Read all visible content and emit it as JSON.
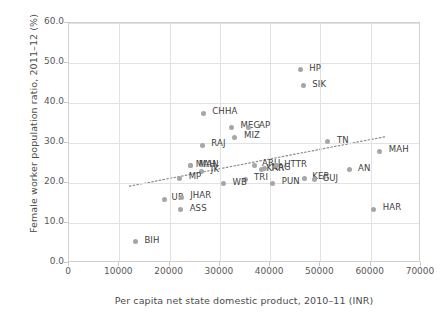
{
  "chart_data": {
    "type": "scatter",
    "title": "",
    "xlabel": "Per capita net state domestic product, 2010–11 (INR)",
    "ylabel": "Female worker population ratio, 2011–12 (%)",
    "xlim": [
      0,
      70000
    ],
    "ylim": [
      0,
      60
    ],
    "xticks": [
      "0",
      "10000",
      "20000",
      "30000",
      "40000",
      "50000",
      "60000",
      "70000"
    ],
    "yticks": [
      "0.0",
      "10.0",
      "20.0",
      "30.0",
      "40.0",
      "50.0",
      "60.0"
    ],
    "grid": true,
    "legend": "none",
    "marker_color": "#a6a6a6",
    "trendline": {
      "visible": true,
      "style": "dotted",
      "color": "#8c8c8c",
      "x_start": 12000,
      "y_start": 19.2,
      "x_end": 63000,
      "y_end": 31.6
    },
    "points": [
      {
        "label": "HP",
        "x": 46000,
        "y": 48.3,
        "label_dx": 9,
        "label_dy": -4
      },
      {
        "label": "SIK",
        "x": 46600,
        "y": 44.3,
        "label_dx": 9,
        "label_dy": -4
      },
      {
        "label": "CHHA",
        "x": 26700,
        "y": 37.5,
        "label_dx": 9,
        "label_dy": -4
      },
      {
        "label": "MEG",
        "x": 32300,
        "y": 34.0,
        "label_dx": 9,
        "label_dy": -4
      },
      {
        "label": "AP",
        "x": 35600,
        "y": 34.0,
        "label_dx": 11,
        "label_dy": -4
      },
      {
        "label": "MIZ",
        "x": 33000,
        "y": 31.5,
        "label_dx": 9,
        "label_dy": -4
      },
      {
        "label": "RAJ",
        "x": 26500,
        "y": 29.5,
        "label_dx": 9,
        "label_dy": -4
      },
      {
        "label": "TN",
        "x": 51500,
        "y": 30.3,
        "label_dx": 9,
        "label_dy": -4
      },
      {
        "label": "MAH",
        "x": 61800,
        "y": 28.0,
        "label_dx": 9,
        "label_dy": -4
      },
      {
        "label": "MAN",
        "x": 24200,
        "y": 24.3,
        "label_dx": 8,
        "label_dy": -4
      },
      {
        "label": "MAH",
        "x": 24200,
        "y": 24.3,
        "label_dx": 5,
        "label_dy": -4
      },
      {
        "label": "JK",
        "x": 26400,
        "y": 23.0,
        "label_dx": 9,
        "label_dy": -4
      },
      {
        "label": "ARU",
        "x": 36800,
        "y": 24.5,
        "label_dx": 8,
        "label_dy": -4
      },
      {
        "label": "NAG",
        "x": 38900,
        "y": 23.6,
        "label_dx": 7,
        "label_dy": -4
      },
      {
        "label": "KAR",
        "x": 38300,
        "y": 23.3,
        "label_dx": 5,
        "label_dy": -4
      },
      {
        "label": "UTTR",
        "x": 41200,
        "y": 24.3,
        "label_dx": 8,
        "label_dy": -4
      },
      {
        "label": "AN",
        "x": 55700,
        "y": 23.3,
        "label_dx": 9,
        "label_dy": -4
      },
      {
        "label": "MP",
        "x": 22000,
        "y": 21.2,
        "label_dx": 9,
        "label_dy": -4
      },
      {
        "label": "TRI",
        "x": 35000,
        "y": 20.9,
        "label_dx": 9,
        "label_dy": -4
      },
      {
        "label": "WB",
        "x": 30700,
        "y": 19.8,
        "label_dx": 9,
        "label_dy": -4
      },
      {
        "label": "PUN",
        "x": 40500,
        "y": 20.0,
        "label_dx": 9,
        "label_dy": -4
      },
      {
        "label": "KER",
        "x": 46800,
        "y": 21.2,
        "label_dx": 8,
        "label_dy": -4
      },
      {
        "label": "GUJ",
        "x": 48800,
        "y": 20.8,
        "label_dx": 8,
        "label_dy": -4
      },
      {
        "label": "UP",
        "x": 19000,
        "y": 15.9,
        "label_dx": 7,
        "label_dy": -4
      },
      {
        "label": "JHAR",
        "x": 22300,
        "y": 16.4,
        "label_dx": 9,
        "label_dy": -4
      },
      {
        "label": "ASS",
        "x": 22200,
        "y": 13.3,
        "label_dx": 9,
        "label_dy": -4
      },
      {
        "label": "HAR",
        "x": 60600,
        "y": 13.5,
        "label_dx": 9,
        "label_dy": -4
      },
      {
        "label": "BIH",
        "x": 13200,
        "y": 5.3,
        "label_dx": 9,
        "label_dy": -4
      }
    ]
  }
}
